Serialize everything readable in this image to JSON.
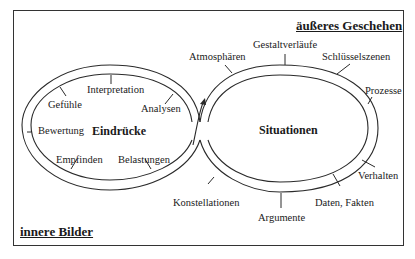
{
  "titles": {
    "outer": "äußeres Geschehen",
    "inner": "innere Bilder"
  },
  "left_loop": {
    "center_label": "Eindrücke",
    "items": [
      "Interpretation",
      "Gefühle",
      "Analysen",
      "Bewertung",
      "Empfinden",
      "Belastungen"
    ]
  },
  "right_loop": {
    "center_label": "Situationen",
    "items": [
      "Atmosphären",
      "Gestaltverläufe",
      "Schlüsselszenen",
      "Prozesse",
      "Verhalten",
      "Daten, Fakten",
      "Argumente",
      "Konstellationen"
    ]
  },
  "colors": {
    "line": "#2a2a2a",
    "text": "#1a1a1a",
    "background": "#ffffff"
  }
}
